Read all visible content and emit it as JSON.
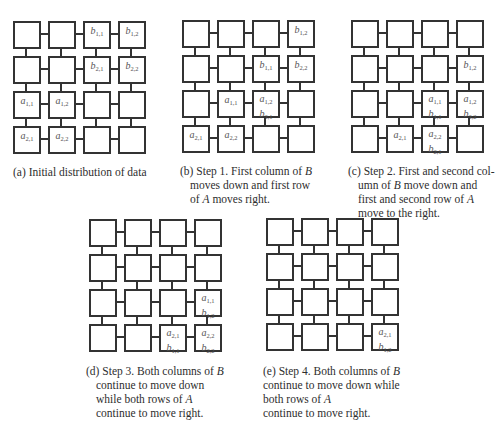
{
  "figure": {
    "grid_size": 4,
    "colors": {
      "border": "#333333",
      "text": "#2e2e2e",
      "label": "#555555"
    },
    "panels": [
      {
        "id": "a",
        "caption_lines": [
          "(a) Initial distribution of data"
        ],
        "cells": {
          "0-2": [
            "b1,1"
          ],
          "0-3": [
            "b1,2"
          ],
          "1-2": [
            "b2,1"
          ],
          "1-3": [
            "b2,2"
          ],
          "2-0": [
            "a1,1"
          ],
          "2-1": [
            "a1,2"
          ],
          "3-0": [
            "a2,1"
          ],
          "3-1": [
            "a2,2"
          ]
        }
      },
      {
        "id": "b",
        "caption_lines": [
          "(b) Step 1. First column of B",
          "moves down and first row",
          "of A moves right."
        ],
        "cells": {
          "0-3": [
            "b1,2"
          ],
          "1-2": [
            "b1,1"
          ],
          "1-3": [
            "b2,2"
          ],
          "2-1": [
            "a1,1"
          ],
          "2-2": [
            "a1,2",
            "b2,1"
          ],
          "3-0": [
            "a2,1"
          ],
          "3-1": [
            "a2,2"
          ]
        }
      },
      {
        "id": "c",
        "caption_lines": [
          "(c) Step 2. First and second col-",
          "umn of B move down and",
          "first and second row of A",
          "move to the right."
        ],
        "cells": {
          "1-3": [
            "b1,2"
          ],
          "2-2": [
            "a1,1",
            "b1,1"
          ],
          "2-3": [
            "a1,2",
            "b2,2"
          ],
          "3-1": [
            "a2,1"
          ],
          "3-2": [
            "a2,2",
            "b2,1"
          ]
        }
      },
      {
        "id": "d",
        "caption_lines": [
          "(d) Step 3. Both columns of B",
          "continue to move down",
          "while both rows of A",
          "continue to move right."
        ],
        "cells": {
          "2-3": [
            "a1,1",
            "b1,2"
          ],
          "3-2": [
            "a2,1",
            "b1,1"
          ],
          "3-3": [
            "a2,2",
            "b2,2"
          ]
        }
      },
      {
        "id": "e",
        "caption_lines": [
          "(e) Step 4. Both columns of B",
          "continue to move down while",
          "both rows of A",
          "continue to move right."
        ],
        "cells": {
          "3-3": [
            "a2,1",
            "b1,2"
          ]
        }
      }
    ]
  }
}
